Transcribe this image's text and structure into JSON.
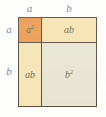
{
  "figure": {
    "kind": "algebraic-area-model",
    "identity": "(a + b)^2 = a^2 + ab + ab + b^2",
    "top_labels": [
      {
        "name": "top-label-a",
        "text": "a"
      },
      {
        "name": "top-label-b",
        "text": "b"
      }
    ],
    "left_labels": [
      {
        "name": "left-label-a",
        "text": "a"
      },
      {
        "name": "left-label-b",
        "text": "b"
      }
    ],
    "cells": [
      {
        "name": "cell-a-squared",
        "base": "a",
        "exponent": "2",
        "label": "a²",
        "fill": "#e8913f",
        "row": "top",
        "col": "left"
      },
      {
        "name": "cell-ab-top-right",
        "base": "ab",
        "exponent": "",
        "label": "ab",
        "fill": "#f7e0ab",
        "row": "top",
        "col": "right"
      },
      {
        "name": "cell-ab-bottom-left",
        "base": "ab",
        "exponent": "",
        "label": "ab",
        "fill": "#f5e3b0",
        "row": "bottom",
        "col": "left"
      },
      {
        "name": "cell-b-squared",
        "base": "b",
        "exponent": "2",
        "label": "b²",
        "fill": "#e6e3cf",
        "row": "bottom",
        "col": "right"
      }
    ],
    "colors": {
      "outline": "#4a3a28",
      "outer_label": "#5b7490",
      "inner_label": "#55553a",
      "background": "#ffffff"
    }
  }
}
